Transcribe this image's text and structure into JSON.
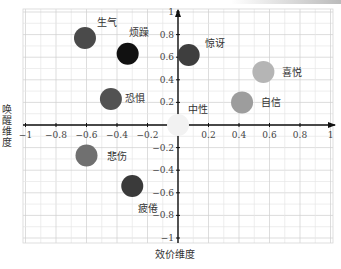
{
  "chart_data": {
    "type": "scatter",
    "title": "",
    "xlabel": "效价维度",
    "ylabel": "唤醒维度",
    "xlim": [
      -1,
      1
    ],
    "ylim": [
      -1,
      1
    ],
    "grid": true,
    "x_ticks": [
      "-1",
      "-0.8",
      "-0.6",
      "-0.4",
      "-0.2",
      "0.2",
      "0.4",
      "0.6",
      "0.8",
      "1"
    ],
    "y_ticks": [
      "1",
      "0.8",
      "0.6",
      "0.4",
      "0.2",
      "-0.2",
      "-0.4",
      "-0.6",
      "-0.8",
      "-1"
    ],
    "points": [
      {
        "label": "生气",
        "x": -0.61,
        "y": 0.77,
        "color": "#4a4a4a"
      },
      {
        "label": "烦躁",
        "x": -0.33,
        "y": 0.63,
        "color": "#111111"
      },
      {
        "label": "惊讶",
        "x": 0.07,
        "y": 0.62,
        "color": "#3e3e3e"
      },
      {
        "label": "喜悦",
        "x": 0.56,
        "y": 0.47,
        "color": "#b5b5b5"
      },
      {
        "label": "自信",
        "x": 0.42,
        "y": 0.2,
        "color": "#9d9d9d"
      },
      {
        "label": "恐惧",
        "x": -0.44,
        "y": 0.23,
        "color": "#525252"
      },
      {
        "label": "中性",
        "x": 0.0,
        "y": 0.0,
        "color": "#f2f2f2"
      },
      {
        "label": "悲伤",
        "x": -0.6,
        "y": -0.27,
        "color": "#707070"
      },
      {
        "label": "疲倦",
        "x": -0.3,
        "y": -0.54,
        "color": "#3a3a3a"
      }
    ]
  }
}
